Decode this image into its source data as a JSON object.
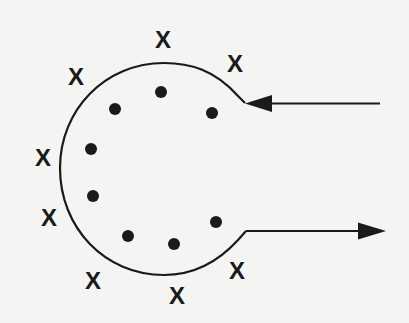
{
  "diagram": {
    "colors": {
      "background": "#f4f4f2",
      "ink": "#1a1a1a"
    },
    "x_marks": [
      {
        "label": "X",
        "x": 163,
        "y": 39
      },
      {
        "label": "X",
        "x": 235,
        "y": 63
      },
      {
        "label": "X",
        "x": 76,
        "y": 76
      },
      {
        "label": "X",
        "x": 43,
        "y": 157
      },
      {
        "label": "X",
        "x": 49,
        "y": 217
      },
      {
        "label": "X",
        "x": 93,
        "y": 280
      },
      {
        "label": "X",
        "x": 177,
        "y": 295
      },
      {
        "label": "X",
        "x": 237,
        "y": 270
      }
    ],
    "dots": [
      {
        "x": 161,
        "y": 92
      },
      {
        "x": 115,
        "y": 109
      },
      {
        "x": 212,
        "y": 113
      },
      {
        "x": 91,
        "y": 149
      },
      {
        "x": 93,
        "y": 196
      },
      {
        "x": 216,
        "y": 222
      },
      {
        "x": 128,
        "y": 236
      },
      {
        "x": 174,
        "y": 244
      }
    ],
    "incoming_arrow": {
      "direction": "left",
      "y": 103
    },
    "outgoing_arrow": {
      "direction": "right",
      "y": 231
    }
  }
}
